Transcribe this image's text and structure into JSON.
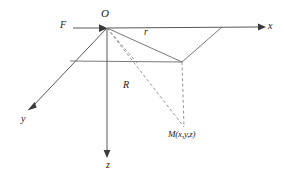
{
  "figure": {
    "name": "spherical-coordinate-axes-diagram",
    "background_color": "#ffffff",
    "line_color": "#58585a",
    "dashed_color": "#8a8a8c",
    "text_color": "#1b1b1b"
  },
  "labels": {
    "origin": "O",
    "focus": "F",
    "x_axis": "x",
    "y_axis": "y",
    "z_axis": "z",
    "radius_small": "r",
    "radius_large": "R",
    "point_m": "M(x,y,z)"
  },
  "geometry": {
    "origin_point": {
      "x": 107,
      "y": 28
    },
    "x_axis_end": {
      "x": 262,
      "y": 27
    },
    "y_axis_end": {
      "x": 28,
      "y": 110
    },
    "z_axis_end": {
      "x": 107,
      "y": 155
    },
    "projection_corner": {
      "x": 182,
      "y": 62
    },
    "plane_left_corner": {
      "x": 70,
      "y": 61
    },
    "plane_right_corner": {
      "x": 222,
      "y": 27
    },
    "point_m": {
      "x": 184,
      "y": 127
    },
    "focus_tail": {
      "x": 73,
      "y": 28
    }
  }
}
